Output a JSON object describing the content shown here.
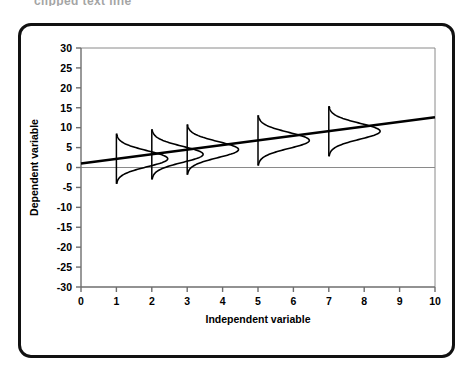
{
  "figure": {
    "scan_artifact_text": "clipped text line",
    "frame": {
      "border_color": "#111111",
      "background": "#ffffff",
      "corner_radius": 13
    }
  },
  "chart_data": {
    "type": "line",
    "title": "",
    "subtitle": "",
    "xlabel": "Independent variable",
    "ylabel": "Dependent variable",
    "xlim": [
      0,
      10
    ],
    "ylim": [
      -30,
      30
    ],
    "xticks": [
      0,
      1,
      2,
      3,
      4,
      5,
      6,
      7,
      8,
      9,
      10
    ],
    "yticks": [
      -30,
      -25,
      -20,
      -15,
      -10,
      -5,
      0,
      5,
      10,
      15,
      20,
      25,
      30
    ],
    "xtick_labels": [
      "0",
      "1",
      "2",
      "3",
      "4",
      "5",
      "6",
      "7",
      "8",
      "9",
      "10"
    ],
    "ytick_labels": [
      "30",
      "25",
      "20",
      "15",
      "10",
      "5",
      "0",
      "-5",
      "-10",
      "-15",
      "-20",
      "-25",
      "-30"
    ],
    "grid": false,
    "legend": null,
    "legend_position": "none",
    "series": [
      {
        "name": "Regression line",
        "type": "line",
        "color": "#000000",
        "line_width": 2.6,
        "x": [
          0,
          10
        ],
        "y": [
          1.0,
          12.6
        ]
      }
    ],
    "regression": {
      "intercept": 1.0,
      "slope": 1.16,
      "equation": "y = 1.0 + 1.16x"
    },
    "annotations": [
      {
        "name": "conditional-distribution",
        "type": "normal-curve",
        "orientation": "vertical-rotated-right",
        "x": 1,
        "mean": 2.2,
        "sd": 2.0,
        "spread_height": 6.3,
        "amplitude": 1.45
      },
      {
        "name": "conditional-distribution",
        "type": "normal-curve",
        "orientation": "vertical-rotated-right",
        "x": 2,
        "mean": 3.3,
        "sd": 2.0,
        "spread_height": 6.3,
        "amplitude": 1.45
      },
      {
        "name": "conditional-distribution",
        "type": "normal-curve",
        "orientation": "vertical-rotated-right",
        "x": 3,
        "mean": 4.5,
        "sd": 2.0,
        "spread_height": 6.3,
        "amplitude": 1.45
      },
      {
        "name": "conditional-distribution",
        "type": "normal-curve",
        "orientation": "vertical-rotated-right",
        "x": 5,
        "mean": 6.8,
        "sd": 2.0,
        "spread_height": 6.3,
        "amplitude": 1.45
      },
      {
        "name": "conditional-distribution",
        "type": "normal-curve",
        "orientation": "vertical-rotated-right",
        "x": 7,
        "mean": 9.1,
        "sd": 2.0,
        "spread_height": 6.3,
        "amplitude": 1.45
      }
    ],
    "reference_lines": [
      {
        "name": "zero-line",
        "axis": "y",
        "value": 0,
        "color": "#8a8a8a",
        "width": 1
      },
      {
        "name": "top-border",
        "axis": "y",
        "value": 30,
        "color": "#8a8a8a",
        "width": 1
      }
    ],
    "axis_style": {
      "axis_color": "#6e6e6e",
      "tick_color": "#6e6e6e",
      "plot_border_color": "#8a8a8a",
      "text_color": "#000000"
    }
  }
}
